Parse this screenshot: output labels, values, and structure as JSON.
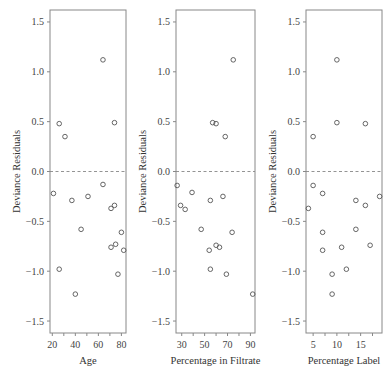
{
  "chart_data": [
    {
      "type": "scatter",
      "title": "",
      "xlabel": "Age",
      "ylabel": "Deviance Residuals",
      "xlim": [
        18,
        84
      ],
      "ylim": [
        -1.62,
        1.62
      ],
      "xticks": [
        20,
        40,
        60,
        80
      ],
      "yticks": [
        -1.5,
        -1.0,
        -0.5,
        0.0,
        0.5,
        1.0,
        1.5
      ],
      "ytick_labels": [
        "−1.5",
        "−1.0",
        "−0.5",
        "0.0",
        "0.5",
        "1.0",
        "1.5"
      ],
      "reference_line": {
        "y": 0.0,
        "style": "dashed"
      },
      "grid": false,
      "points": [
        {
          "x": 26,
          "y": 0.48
        },
        {
          "x": 31,
          "y": 0.35
        },
        {
          "x": 74,
          "y": 0.49
        },
        {
          "x": 64,
          "y": 1.12
        },
        {
          "x": 21,
          "y": -0.22
        },
        {
          "x": 37,
          "y": -0.29
        },
        {
          "x": 51,
          "y": -0.25
        },
        {
          "x": 64,
          "y": -0.13
        },
        {
          "x": 71,
          "y": -0.37
        },
        {
          "x": 74,
          "y": -0.34
        },
        {
          "x": 45,
          "y": -0.58
        },
        {
          "x": 80,
          "y": -0.61
        },
        {
          "x": 71,
          "y": -0.76
        },
        {
          "x": 75,
          "y": -0.73
        },
        {
          "x": 82,
          "y": -0.79
        },
        {
          "x": 26,
          "y": -0.98
        },
        {
          "x": 77,
          "y": -1.03
        },
        {
          "x": 40,
          "y": -1.23
        }
      ]
    },
    {
      "type": "scatter",
      "title": "",
      "xlabel": "Percentage in Filtrate",
      "ylabel": "Deviance Residuals",
      "xlim": [
        25,
        94
      ],
      "ylim": [
        -1.62,
        1.62
      ],
      "xticks": [
        30,
        50,
        70,
        90
      ],
      "yticks": [
        -1.5,
        -1.0,
        -0.5,
        0.0,
        0.5,
        1.0,
        1.5
      ],
      "ytick_labels": [
        "−1.5",
        "−1.0",
        "−0.5",
        "0.0",
        "0.5",
        "1.0",
        "1.5"
      ],
      "reference_line": {
        "y": 0.0,
        "style": "dashed"
      },
      "grid": false,
      "points": [
        {
          "x": 57,
          "y": 0.49
        },
        {
          "x": 60,
          "y": 0.48
        },
        {
          "x": 68,
          "y": 0.35
        },
        {
          "x": 75,
          "y": 1.12
        },
        {
          "x": 26,
          "y": -0.14
        },
        {
          "x": 39,
          "y": -0.21
        },
        {
          "x": 29,
          "y": -0.34
        },
        {
          "x": 33,
          "y": -0.38
        },
        {
          "x": 55,
          "y": -0.29
        },
        {
          "x": 66,
          "y": -0.25
        },
        {
          "x": 47,
          "y": -0.58
        },
        {
          "x": 74,
          "y": -0.61
        },
        {
          "x": 60,
          "y": -0.74
        },
        {
          "x": 63,
          "y": -0.76
        },
        {
          "x": 54,
          "y": -0.79
        },
        {
          "x": 55,
          "y": -0.98
        },
        {
          "x": 69,
          "y": -1.03
        },
        {
          "x": 92,
          "y": -1.23
        }
      ]
    },
    {
      "type": "scatter",
      "title": "",
      "xlabel": "Percentage Label",
      "ylabel": "Deviance Residuals",
      "xlim": [
        3.5,
        19.5
      ],
      "ylim": [
        -1.62,
        1.62
      ],
      "xticks": [
        5,
        10,
        15
      ],
      "yticks": [
        -1.5,
        -1.0,
        -0.5,
        0.0,
        0.5,
        1.0,
        1.5
      ],
      "ytick_labels": [
        "−1.5",
        "−1.0",
        "−0.5",
        "0.0",
        "0.5",
        "1.0",
        "1.5"
      ],
      "reference_line": {
        "y": 0.0,
        "style": "dashed"
      },
      "grid": false,
      "points": [
        {
          "x": 5,
          "y": 0.35
        },
        {
          "x": 10,
          "y": 0.49
        },
        {
          "x": 16,
          "y": 0.48
        },
        {
          "x": 10,
          "y": 1.12
        },
        {
          "x": 5,
          "y": -0.14
        },
        {
          "x": 7,
          "y": -0.22
        },
        {
          "x": 4,
          "y": -0.37
        },
        {
          "x": 14,
          "y": -0.29
        },
        {
          "x": 16,
          "y": -0.34
        },
        {
          "x": 19,
          "y": -0.25
        },
        {
          "x": 7,
          "y": -0.61
        },
        {
          "x": 14,
          "y": -0.58
        },
        {
          "x": 7,
          "y": -0.79
        },
        {
          "x": 11,
          "y": -0.76
        },
        {
          "x": 17,
          "y": -0.74
        },
        {
          "x": 12,
          "y": -0.98
        },
        {
          "x": 9,
          "y": -1.03
        },
        {
          "x": 9,
          "y": -1.23
        }
      ]
    }
  ],
  "colors": {
    "frame": "#888888",
    "points": "#555555",
    "reference_line": "#888888",
    "text": "#333333"
  }
}
